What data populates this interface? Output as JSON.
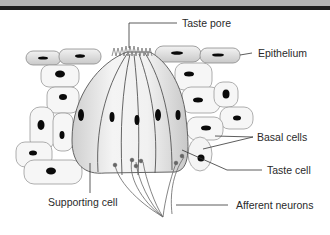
{
  "diagram": {
    "labels": {
      "taste_pore": "Taste pore",
      "epithelium": "Epithelium",
      "basal_cells": "Basal cells",
      "taste_cell": "Taste cell",
      "supporting_cell": "Supporting cell",
      "afferent_neurons": "Afferent neurons"
    },
    "colors": {
      "header_light": "#b4b4b4",
      "header_dark": "#1e1e1e",
      "cell_outline": "#8a8a8a",
      "nucleus": "#0a0a0a",
      "leader_line": "#333333",
      "label_text": "#2a2a2a"
    }
  }
}
